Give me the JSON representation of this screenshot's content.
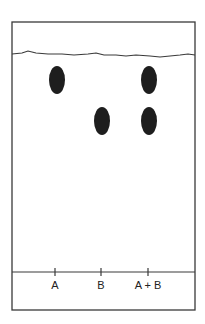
{
  "diagram": {
    "type": "thin-layer-chromatography-plate",
    "colors": {
      "line": "#3a3a3a",
      "spot": "#1e1e1e",
      "background": "#ffffff"
    },
    "plate": {
      "x": 12,
      "y": 22,
      "width": 183,
      "height": 288
    },
    "solvent_front_path": "M12,54 L22,53 L28,51 L36,53 L48,54 L62,54 L74,55 L88,54 L96,53 L104,55 L116,55 L126,56 L136,55 L150,56 L160,57 L170,56 L180,55 L188,54 L195,55",
    "baseline_y": 272,
    "lanes": [
      {
        "label": "A",
        "x": 55,
        "spots": [
          {
            "cx": 57,
            "cy": 80,
            "rx": 8,
            "ry": 14
          }
        ]
      },
      {
        "label": "B",
        "x": 101,
        "spots": [
          {
            "cx": 102,
            "cy": 121,
            "rx": 8,
            "ry": 14
          }
        ]
      },
      {
        "label": "A + B",
        "x": 148,
        "spots": [
          {
            "cx": 149,
            "cy": 80,
            "rx": 8,
            "ry": 14
          },
          {
            "cx": 149,
            "cy": 121,
            "rx": 8,
            "ry": 14
          }
        ]
      }
    ],
    "label_y": 289
  }
}
